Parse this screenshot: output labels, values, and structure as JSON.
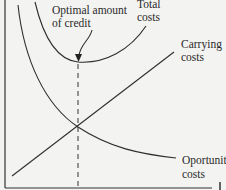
{
  "diagram": {
    "type": "credit-cost-tradeoff",
    "labels": {
      "optimal_line1": "Optimal amount",
      "optimal_line2": "of credit",
      "total_line1": "Total",
      "total_line2": "costs",
      "carrying_line1": "Carrying",
      "carrying_line2": "costs",
      "opportunity_line1": "Oportunity",
      "opportunity_line2": "costs"
    },
    "curves": [
      {
        "name": "Total costs",
        "shape": "U-shaped, minimum at optimal amount"
      },
      {
        "name": "Carrying costs",
        "shape": "upward-sloping straight line"
      },
      {
        "name": "Opportunity costs",
        "shape": "downward-sloping convex curve"
      }
    ],
    "annotations": [
      "dashed vertical line at optimal amount of credit, through intersection of carrying and opportunity costs"
    ]
  }
}
